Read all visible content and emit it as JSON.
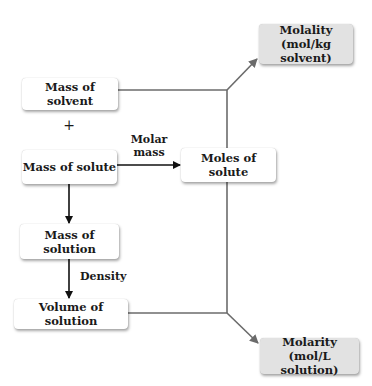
{
  "diagram": {
    "nodes": {
      "mass_solvent": "Mass of solvent",
      "mass_solute": "Mass of solute",
      "moles_solute": "Moles of solute",
      "mass_solution": "Mass of solution",
      "volume_solution": "Volume of solution",
      "molality_line1": "Molality",
      "molality_line2": "(mol/kg solvent)",
      "molarity_line1": "Molarity",
      "molarity_line2": "(mol/L solution)"
    },
    "labels": {
      "plus": "+",
      "molar_mass_line1": "Molar",
      "molar_mass_line2": "mass",
      "density": "Density"
    },
    "colors": {
      "arrow_dark": "#111111",
      "arrow_gray": "#6b6b6b",
      "result_fill": "#e2e2e2"
    }
  }
}
